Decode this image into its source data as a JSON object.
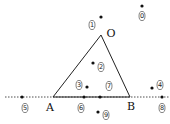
{
  "diagram": {
    "type": "geometry",
    "colors": {
      "line": "#222222",
      "dot": "#111111",
      "background": "#ffffff"
    },
    "vertices": [
      {
        "name": "O",
        "label": "O",
        "x": 101,
        "y": 35,
        "lx": 111,
        "ly": 37
      },
      {
        "name": "A",
        "label": "A",
        "x": 53,
        "y": 97,
        "lx": 50,
        "ly": 111
      },
      {
        "name": "B",
        "label": "B",
        "x": 130,
        "y": 97,
        "lx": 131,
        "ly": 110
      }
    ],
    "line_AB": {
      "style": "dashed-extension",
      "x1": 5,
      "x2": 170,
      "y": 97
    },
    "points": [
      {
        "id": "0",
        "label": "0",
        "x": 142,
        "y": 6,
        "lx": 142,
        "ly": 16
      },
      {
        "id": "1",
        "label": "1",
        "x": 101,
        "y": 17,
        "lx": 92,
        "ly": 25
      },
      {
        "id": "2",
        "label": "2",
        "x": 93,
        "y": 63,
        "lx": 101,
        "ly": 67
      },
      {
        "id": "3",
        "label": "3",
        "x": 87,
        "y": 87,
        "lx": 79,
        "ly": 85
      },
      {
        "id": "4",
        "label": "4",
        "x": 152,
        "y": 88,
        "lx": 160,
        "ly": 85
      },
      {
        "id": "5",
        "label": "5",
        "x": 22,
        "y": 97,
        "lx": 25,
        "ly": 108
      },
      {
        "id": "6",
        "label": "6",
        "x": 84,
        "y": 97,
        "lx": 81,
        "ly": 108
      },
      {
        "id": "7",
        "label": "7",
        "x": 100,
        "y": 97,
        "lx": 109,
        "ly": 86
      },
      {
        "id": "8",
        "label": "8",
        "x": 162,
        "y": 97,
        "lx": 162,
        "ly": 108
      },
      {
        "id": "9",
        "label": "9",
        "x": 98,
        "y": 112,
        "lx": 106,
        "ly": 115
      }
    ]
  }
}
